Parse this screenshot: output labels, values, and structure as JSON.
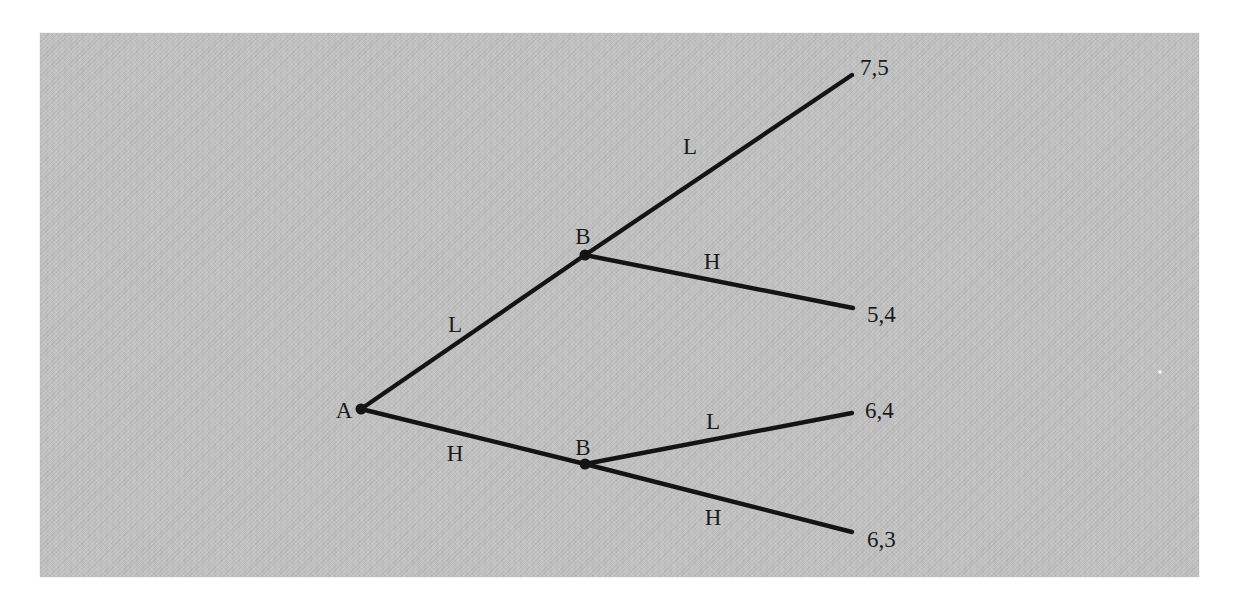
{
  "figure": {
    "type": "game-tree",
    "colors": {
      "page_bg": "#ffffff",
      "panel_bg": "#c2c2c2",
      "line": "#141414",
      "text": "#1b1b1b"
    },
    "tree": {
      "root": {
        "label": "A",
        "children": [
          {
            "edge": "L",
            "node": "B",
            "children": [
              {
                "edge": "L",
                "payoff": "7,5"
              },
              {
                "edge": "H",
                "payoff": "5,4"
              }
            ]
          },
          {
            "edge": "H",
            "node": "B",
            "children": [
              {
                "edge": "L",
                "payoff": "6,4"
              },
              {
                "edge": "H",
                "payoff": "6,3"
              }
            ]
          }
        ]
      }
    }
  }
}
